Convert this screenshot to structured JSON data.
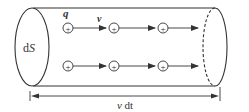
{
  "diagram": {
    "title": "",
    "labels": {
      "area": "dS",
      "charge": "q",
      "velocity": "v",
      "length": "v dt"
    },
    "charge_symbol": "+",
    "rows": [
      {
        "y": 28,
        "charges_x": [
          68,
          114,
          163
        ]
      },
      {
        "y": 66,
        "charges_x": [
          68,
          114,
          163
        ]
      }
    ],
    "colors": {
      "stroke": "#333333",
      "background": "#ffffff"
    }
  }
}
